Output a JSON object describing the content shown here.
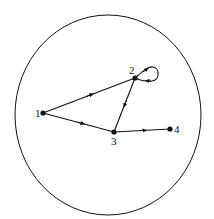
{
  "diagram": {
    "type": "directed-graph",
    "boundary": {
      "shape": "circle",
      "cx": 108,
      "cy": 115,
      "rx": 93,
      "ry": 100
    },
    "nodes": [
      {
        "id": "1",
        "label": "1",
        "x": 43,
        "y": 113
      },
      {
        "id": "2",
        "label": "2",
        "x": 135,
        "y": 78
      },
      {
        "id": "3",
        "label": "3",
        "x": 114,
        "y": 132
      },
      {
        "id": "4",
        "label": "4",
        "x": 170,
        "y": 129
      }
    ],
    "edges": [
      {
        "from": "1",
        "to": "2"
      },
      {
        "from": "1",
        "to": "3"
      },
      {
        "from": "2",
        "to": "3"
      },
      {
        "from": "3",
        "to": "4"
      },
      {
        "from": "2",
        "to": "2",
        "kind": "self-loop"
      }
    ],
    "colors": {
      "stroke": "#111111",
      "background": "#ffffff"
    }
  }
}
